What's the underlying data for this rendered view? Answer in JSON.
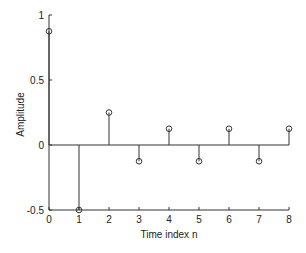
{
  "chart_data": {
    "type": "stem",
    "title": "",
    "xlabel": "Time index n",
    "ylabel": "Amplitude",
    "x": [
      0,
      1,
      2,
      3,
      4,
      5,
      6,
      7,
      8
    ],
    "values": [
      0.875,
      -0.5,
      0.25,
      -0.125,
      0.125,
      -0.125,
      0.125,
      -0.125,
      0.125
    ],
    "xlim": [
      0,
      8
    ],
    "ylim": [
      -0.5,
      1
    ],
    "xticks": [
      "0",
      "1",
      "2",
      "3",
      "4",
      "5",
      "6",
      "7",
      "8"
    ],
    "yticks": [
      "-0.5",
      "0",
      "0.5",
      "1"
    ],
    "grid": false,
    "marker": "open-circle",
    "color": "#333333"
  }
}
